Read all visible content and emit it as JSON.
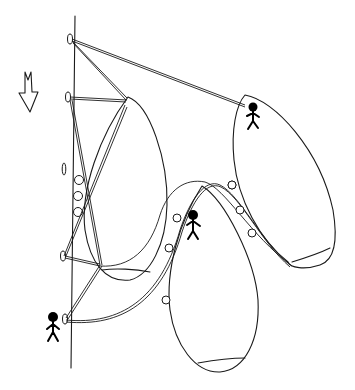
{
  "diagram": {
    "type": "hand-drawn sketch",
    "colors": {
      "ink": "#1a1a1a",
      "background": "#ffffff"
    },
    "elements": {
      "wall": {
        "label": ""
      },
      "direction_arrow": {
        "icon": "down-arrow-icon",
        "label": ""
      },
      "anchors": [
        {
          "id": "anchor-1"
        },
        {
          "id": "anchor-2"
        },
        {
          "id": "anchor-3"
        },
        {
          "id": "anchor-4"
        }
      ],
      "loops": [
        {
          "id": "loop-left"
        },
        {
          "id": "loop-middle"
        },
        {
          "id": "loop-right"
        }
      ],
      "figures": [
        {
          "id": "climber-right-loop"
        },
        {
          "id": "climber-middle-loop"
        },
        {
          "id": "climber-wall-bottom"
        }
      ]
    },
    "text_labels": []
  }
}
